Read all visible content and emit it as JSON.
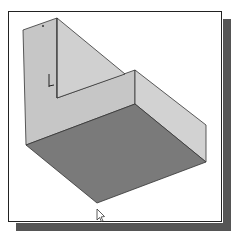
{
  "figure": {
    "colors": {
      "background": "#ffffff",
      "frame_border": "#222222",
      "frame_shadow": "#555555",
      "back_wall": "#c6c6c6",
      "right_wall": "#d2d2d2",
      "floor": "#7a7a7a",
      "edge": "#333333"
    },
    "elements": {
      "back_wall": "sloped back face",
      "step_wall": "inner step face",
      "right_wall": "right side face",
      "floor": "bottom floor face",
      "triad": "coordinate triad icon",
      "cursor": "mouse pointer"
    }
  }
}
